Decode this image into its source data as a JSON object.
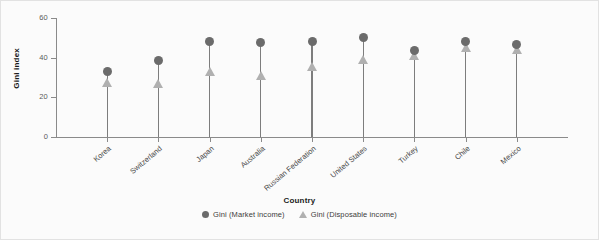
{
  "chart_data": {
    "type": "scatter",
    "title": "",
    "subtitle": "",
    "xlabel": "Country",
    "ylabel": "Gini index",
    "categories": [
      "Korea",
      "Switzerland",
      "Japan",
      "Australia",
      "Russian Federation",
      "United States",
      "Turkey",
      "Chile",
      "Mexico"
    ],
    "series": [
      {
        "name": "Gini (Market income)",
        "marker": "circle",
        "color": "#6b6b6b",
        "values": [
          33.0,
          38.8,
          48.0,
          47.6,
          48.0,
          50.0,
          43.4,
          48.0,
          46.5
        ]
      },
      {
        "name": "Gini (Disposable income)",
        "marker": "triangle",
        "color": "#b0b0b0",
        "values": [
          27.5,
          27.0,
          33.0,
          31.0,
          35.7,
          39.3,
          41.0,
          45.0,
          44.0
        ]
      }
    ],
    "ylim": [
      0,
      60
    ],
    "yticks": [
      0,
      20,
      40,
      60
    ],
    "ytick_labels": [
      "0",
      "20",
      "40",
      "60"
    ],
    "grid": false,
    "legend_position": "bottom"
  },
  "axes": {
    "y_title": "Gini index",
    "x_title": "Country"
  },
  "legend": {
    "entries": [
      {
        "label": "Gini (Market income)",
        "marker": "circle-icon"
      },
      {
        "label": "Gini (Disposable income)",
        "marker": "triangle-icon"
      }
    ]
  }
}
